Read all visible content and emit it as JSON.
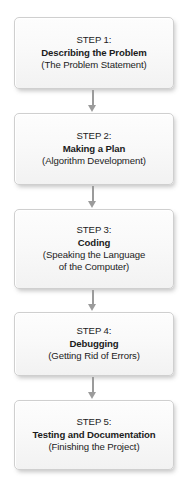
{
  "diagram": {
    "orientation": "vertical-top-to-bottom",
    "colors": {
      "box_border": "#cfcfcf",
      "box_fill_top": "#fdfdfd",
      "box_fill_bottom": "#f2f2f2",
      "arrow": "#9b9b9b",
      "text": "#1c1c1c",
      "background": "#ffffff"
    },
    "steps": [
      {
        "label": "STEP 1:",
        "title": "Describing the Problem",
        "note": "(The Problem Statement)",
        "note2": ""
      },
      {
        "label": "STEP 2:",
        "title": "Making a Plan",
        "note": "(Algorithm Development)",
        "note2": ""
      },
      {
        "label": "STEP 3:",
        "title": "Coding",
        "note": "(Speaking the Language",
        "note2": "of the Computer)"
      },
      {
        "label": "STEP 4:",
        "title": "Debugging",
        "note": "(Getting Rid of Errors)",
        "note2": ""
      },
      {
        "label": "STEP 5:",
        "title": "Testing and Documentation",
        "note": "(Finishing the Project)",
        "note2": ""
      }
    ],
    "connectors": [
      {
        "from": "STEP 1:",
        "to": "STEP 2:",
        "glyph": "down-arrow"
      },
      {
        "from": "STEP 2:",
        "to": "STEP 3:",
        "glyph": "down-arrow"
      },
      {
        "from": "STEP 3:",
        "to": "STEP 4:",
        "glyph": "down-arrow"
      },
      {
        "from": "STEP 4:",
        "to": "STEP 5:",
        "glyph": "down-arrow"
      }
    ]
  }
}
